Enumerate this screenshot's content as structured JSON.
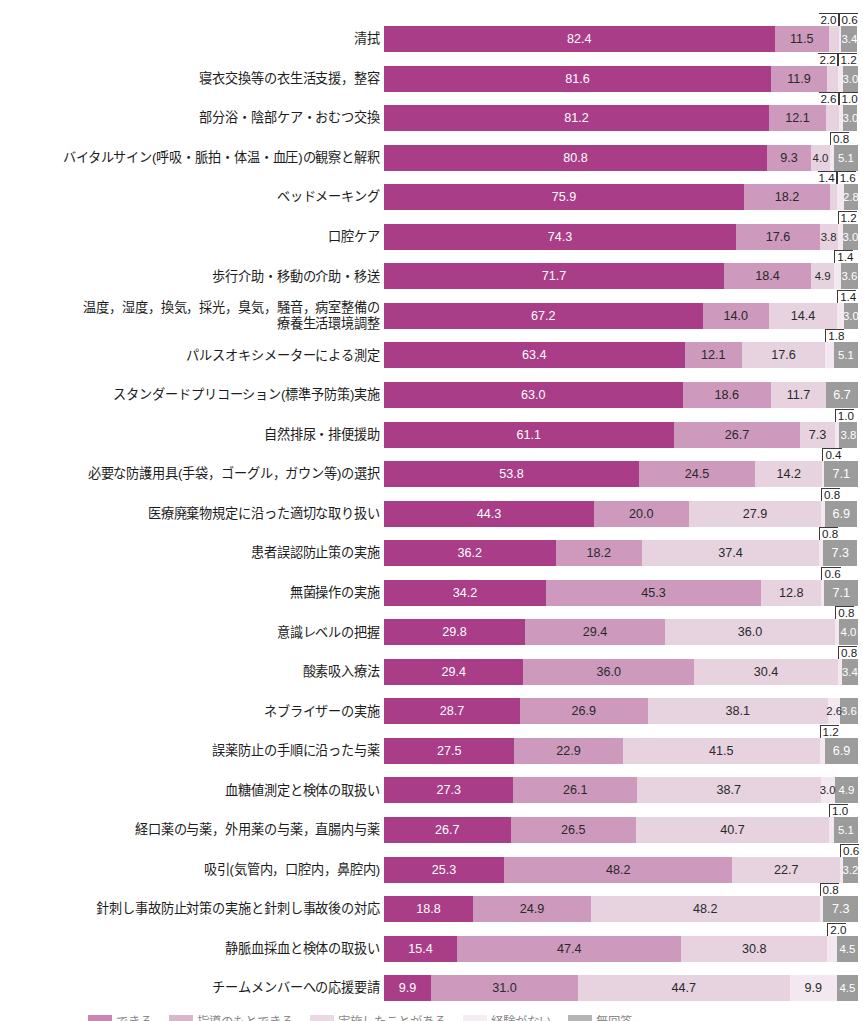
{
  "chart_data": {
    "type": "bar",
    "subtype": "horizontal-stacked-100",
    "title": "",
    "xlabel": "",
    "ylabel": "",
    "xlim": [
      0,
      100
    ],
    "grid": false,
    "legend_position": "bottom",
    "value_unit": "%",
    "legend": [
      "できる",
      "指導のもとできる",
      "実施したことがある",
      "経験がない",
      "無回答"
    ],
    "series": [
      {
        "name": "できる",
        "color": "#a93d87"
      },
      {
        "name": "指導のもとできる",
        "color": "#cd99bd"
      },
      {
        "name": "実施したことがある",
        "color": "#e7d2e0"
      },
      {
        "name": "経験がない",
        "color": "#f4e8f0"
      },
      {
        "name": "無回答",
        "color": "#9c9c9c"
      }
    ],
    "categories": [
      "清拭",
      "寝衣交換等の衣生活支援，整容",
      "部分浴・陰部ケア・おむつ交換",
      "バイタルサイン(呼吸・脈拍・体温・血圧)の観察と解釈",
      "ベッドメーキング",
      "口腔ケア",
      "歩行介助・移動の介助・移送",
      "温度，湿度，換気，採光，臭気，騒音，病室整備の\n療養生活環境調整",
      "パルスオキシメーターによる測定",
      "スタンダードプリコーション(標準予防策)実施",
      "自然排尿・排便援助",
      "必要な防護用具(手袋，ゴーグル，ガウン等)の選択",
      "医療廃棄物規定に沿った適切な取り扱い",
      "患者誤認防止策の実施",
      "無菌操作の実施",
      "意識レベルの把握",
      "酸素吸入療法",
      "ネブライザーの実施",
      "誤薬防止の手順に沿った与薬",
      "血糖値測定と検体の取扱い",
      "経口薬の与薬，外用薬の与薬，直腸内与薬",
      "吸引(気管内，口腔内，鼻腔内)",
      "針刺し事故防止対策の実施と針刺し事故後の対応",
      "静脈血採血と検体の取扱い",
      "チームメンバーへの応援要請"
    ],
    "values": [
      [
        82.4,
        11.5,
        2.0,
        0.6,
        3.4
      ],
      [
        81.6,
        11.9,
        2.2,
        1.2,
        3.0
      ],
      [
        81.2,
        12.1,
        2.6,
        1.0,
        3.0
      ],
      [
        80.8,
        9.3,
        4.0,
        0.8,
        5.1
      ],
      [
        75.9,
        18.2,
        1.4,
        1.6,
        2.8
      ],
      [
        74.3,
        17.6,
        3.8,
        1.2,
        3.0
      ],
      [
        71.7,
        18.4,
        4.9,
        1.4,
        3.6
      ],
      [
        67.2,
        14.0,
        14.4,
        1.4,
        3.0
      ],
      [
        63.4,
        12.1,
        17.6,
        1.8,
        5.1
      ],
      [
        63.0,
        18.6,
        11.7,
        0.0,
        6.7
      ],
      [
        61.1,
        26.7,
        7.3,
        1.0,
        3.8
      ],
      [
        53.8,
        24.5,
        14.2,
        0.4,
        7.1
      ],
      [
        44.3,
        20.0,
        27.9,
        0.8,
        6.9
      ],
      [
        36.2,
        18.2,
        37.4,
        0.8,
        7.3
      ],
      [
        34.2,
        45.3,
        12.8,
        0.6,
        7.1
      ],
      [
        29.8,
        29.4,
        36.0,
        0.8,
        4.0
      ],
      [
        29.4,
        36.0,
        30.4,
        0.8,
        3.4
      ],
      [
        28.7,
        26.9,
        38.1,
        2.6,
        3.6
      ],
      [
        27.5,
        22.9,
        41.5,
        1.2,
        6.9
      ],
      [
        27.3,
        26.1,
        38.7,
        3.0,
        4.9
      ],
      [
        26.7,
        26.5,
        40.7,
        1.0,
        5.1
      ],
      [
        25.3,
        48.2,
        22.7,
        0.6,
        3.2
      ],
      [
        18.8,
        24.9,
        48.2,
        0.8,
        7.3
      ],
      [
        15.4,
        47.4,
        30.8,
        2.0,
        4.5
      ],
      [
        9.9,
        31.0,
        44.7,
        9.9,
        4.5
      ]
    ],
    "rows": [
      {
        "label": "清拭",
        "values": [
          82.4,
          11.5,
          2.0,
          0.6,
          3.4
        ],
        "labels": [
          "82.4",
          "11.5",
          "2.0",
          "0.6",
          "3.4"
        ],
        "placement": [
          "in",
          "in",
          "callout-right",
          "callout-left",
          "in"
        ]
      },
      {
        "label": "寝衣交換等の衣生活支援，整容",
        "values": [
          81.6,
          11.9,
          2.2,
          1.2,
          3.0
        ],
        "labels": [
          "81.6",
          "11.9",
          "2.2",
          "1.2",
          "3.0"
        ],
        "placement": [
          "in",
          "in",
          "callout-right",
          "callout-left",
          "in"
        ]
      },
      {
        "label": "部分浴・陰部ケア・おむつ交換",
        "values": [
          81.2,
          12.1,
          2.6,
          1.0,
          3.0
        ],
        "labels": [
          "81.2",
          "12.1",
          "2.6",
          "1.0",
          "3.0"
        ],
        "placement": [
          "in",
          "in",
          "callout-right",
          "callout-left",
          "in"
        ]
      },
      {
        "label": "バイタルサイン(呼吸・脈拍・体温・血圧)の観察と解釈",
        "values": [
          80.8,
          9.3,
          4.0,
          0.8,
          5.1
        ],
        "labels": [
          "80.8",
          "9.3",
          "4.0",
          "0.8",
          "5.1"
        ],
        "placement": [
          "in",
          "in",
          "in",
          "callout-left",
          "in"
        ]
      },
      {
        "label": "ベッドメーキング",
        "values": [
          75.9,
          18.2,
          1.4,
          1.6,
          2.8
        ],
        "labels": [
          "75.9",
          "18.2",
          "1.4",
          "1.6",
          "2.8"
        ],
        "placement": [
          "in",
          "in",
          "callout-right",
          "callout-left",
          "in"
        ]
      },
      {
        "label": "口腔ケア",
        "values": [
          74.3,
          17.6,
          3.8,
          1.2,
          3.0
        ],
        "labels": [
          "74.3",
          "17.6",
          "3.8",
          "1.2",
          "3.0"
        ],
        "placement": [
          "in",
          "in",
          "in",
          "callout-left",
          "in"
        ]
      },
      {
        "label": "歩行介助・移動の介助・移送",
        "values": [
          71.7,
          18.4,
          4.9,
          1.4,
          3.6
        ],
        "labels": [
          "71.7",
          "18.4",
          "4.9",
          "1.4",
          "3.6"
        ],
        "placement": [
          "in",
          "in",
          "in",
          "callout-left",
          "in"
        ]
      },
      {
        "label": "温度，湿度，換気，採光，臭気，騒音，病室整備の\n療養生活環境調整",
        "values": [
          67.2,
          14.0,
          14.4,
          1.4,
          3.0
        ],
        "labels": [
          "67.2",
          "14.0",
          "14.4",
          "1.4",
          "3.0"
        ],
        "placement": [
          "in",
          "in",
          "in",
          "callout-left",
          "in"
        ]
      },
      {
        "label": "パルスオキシメーターによる測定",
        "values": [
          63.4,
          12.1,
          17.6,
          1.8,
          5.1
        ],
        "labels": [
          "63.4",
          "12.1",
          "17.6",
          "1.8",
          "5.1"
        ],
        "placement": [
          "in",
          "in",
          "in",
          "callout-left",
          "in"
        ]
      },
      {
        "label": "スタンダードプリコーション(標準予防策)実施",
        "values": [
          63.0,
          18.6,
          11.7,
          0.0,
          6.7
        ],
        "labels": [
          "63.0",
          "18.6",
          "11.7",
          "",
          "6.7"
        ],
        "placement": [
          "in",
          "in",
          "in",
          "none",
          "in"
        ]
      },
      {
        "label": "自然排尿・排便援助",
        "values": [
          61.1,
          26.7,
          7.3,
          1.0,
          3.8
        ],
        "labels": [
          "61.1",
          "26.7",
          "7.3",
          "1.0",
          "3.8"
        ],
        "placement": [
          "in",
          "in",
          "in",
          "callout-left",
          "in"
        ]
      },
      {
        "label": "必要な防護用具(手袋，ゴーグル，ガウン等)の選択",
        "values": [
          53.8,
          24.5,
          14.2,
          0.4,
          7.1
        ],
        "labels": [
          "53.8",
          "24.5",
          "14.2",
          "0.4",
          "7.1"
        ],
        "placement": [
          "in",
          "in",
          "in",
          "callout-left",
          "in"
        ]
      },
      {
        "label": "医療廃棄物規定に沿った適切な取り扱い",
        "values": [
          44.3,
          20.0,
          27.9,
          0.8,
          6.9
        ],
        "labels": [
          "44.3",
          "20.0",
          "27.9",
          "0.8",
          "6.9"
        ],
        "placement": [
          "in",
          "in",
          "in",
          "callout-left",
          "in"
        ]
      },
      {
        "label": "患者誤認防止策の実施",
        "values": [
          36.2,
          18.2,
          37.4,
          0.8,
          7.3
        ],
        "labels": [
          "36.2",
          "18.2",
          "37.4",
          "0.8",
          "7.3"
        ],
        "placement": [
          "in",
          "in",
          "in",
          "callout-left",
          "in"
        ]
      },
      {
        "label": "無菌操作の実施",
        "values": [
          34.2,
          45.3,
          12.8,
          0.6,
          7.1
        ],
        "labels": [
          "34.2",
          "45.3",
          "12.8",
          "0.6",
          "7.1"
        ],
        "placement": [
          "in",
          "in",
          "in",
          "callout-left",
          "in"
        ]
      },
      {
        "label": "意識レベルの把握",
        "values": [
          29.8,
          29.4,
          36.0,
          0.8,
          4.0
        ],
        "labels": [
          "29.8",
          "29.4",
          "36.0",
          "0.8",
          "4.0"
        ],
        "placement": [
          "in",
          "in",
          "in",
          "callout-left",
          "in"
        ]
      },
      {
        "label": "酸素吸入療法",
        "values": [
          29.4,
          36.0,
          30.4,
          0.8,
          3.4
        ],
        "labels": [
          "29.4",
          "36.0",
          "30.4",
          "0.8",
          "3.4"
        ],
        "placement": [
          "in",
          "in",
          "in",
          "callout-left",
          "in"
        ]
      },
      {
        "label": "ネブライザーの実施",
        "values": [
          28.7,
          26.9,
          38.1,
          2.6,
          3.6
        ],
        "labels": [
          "28.7",
          "26.9",
          "38.1",
          "2.6",
          "3.6"
        ],
        "placement": [
          "in",
          "in",
          "in",
          "in",
          "in"
        ]
      },
      {
        "label": "誤薬防止の手順に沿った与薬",
        "values": [
          27.5,
          22.9,
          41.5,
          1.2,
          6.9
        ],
        "labels": [
          "27.5",
          "22.9",
          "41.5",
          "1.2",
          "6.9"
        ],
        "placement": [
          "in",
          "in",
          "in",
          "callout-left",
          "in"
        ]
      },
      {
        "label": "血糖値測定と検体の取扱い",
        "values": [
          27.3,
          26.1,
          38.7,
          3.0,
          4.9
        ],
        "labels": [
          "27.3",
          "26.1",
          "38.7",
          "3.0",
          "4.9"
        ],
        "placement": [
          "in",
          "in",
          "in",
          "in",
          "in"
        ]
      },
      {
        "label": "経口薬の与薬，外用薬の与薬，直腸内与薬",
        "values": [
          26.7,
          26.5,
          40.7,
          1.0,
          5.1
        ],
        "labels": [
          "26.7",
          "26.5",
          "40.7",
          "1.0",
          "5.1"
        ],
        "placement": [
          "in",
          "in",
          "in",
          "callout-left",
          "in"
        ]
      },
      {
        "label": "吸引(気管内，口腔内，鼻腔内)",
        "values": [
          25.3,
          48.2,
          22.7,
          0.6,
          3.2
        ],
        "labels": [
          "25.3",
          "48.2",
          "22.7",
          "0.6",
          "3.2"
        ],
        "placement": [
          "in",
          "in",
          "in",
          "callout-left",
          "in"
        ]
      },
      {
        "label": "針刺し事故防止対策の実施と針刺し事故後の対応",
        "values": [
          18.8,
          24.9,
          48.2,
          0.8,
          7.3
        ],
        "labels": [
          "18.8",
          "24.9",
          "48.2",
          "0.8",
          "7.3"
        ],
        "placement": [
          "in",
          "in",
          "in",
          "callout-left",
          "in"
        ]
      },
      {
        "label": "静脈血採血と検体の取扱い",
        "values": [
          15.4,
          47.4,
          30.8,
          2.0,
          4.5
        ],
        "labels": [
          "15.4",
          "47.4",
          "30.8",
          "2.0",
          "4.5"
        ],
        "placement": [
          "in",
          "in",
          "in",
          "callout-left",
          "in"
        ]
      },
      {
        "label": "チームメンバーへの応援要請",
        "values": [
          9.9,
          31.0,
          44.7,
          9.9,
          4.5
        ],
        "labels": [
          "9.9",
          "31.0",
          "44.7",
          "9.9",
          "4.5"
        ],
        "placement": [
          "in",
          "in",
          "in",
          "in",
          "in"
        ]
      }
    ]
  }
}
